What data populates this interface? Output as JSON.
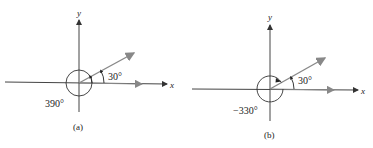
{
  "figure": {
    "panels": [
      {
        "id": "a",
        "caption": "(a)",
        "x_axis_label": "x",
        "y_axis_label": "y",
        "reference_angle_label": "30°",
        "total_angle_label": "390°",
        "direction": "counterclockwise"
      },
      {
        "id": "b",
        "caption": "(b)",
        "x_axis_label": "x",
        "y_axis_label": "y",
        "reference_angle_label": "30°",
        "total_angle_label": "−330°",
        "direction": "clockwise"
      }
    ],
    "colors": {
      "axis": "#333333",
      "ray": "#777777",
      "text": "#222222"
    }
  }
}
